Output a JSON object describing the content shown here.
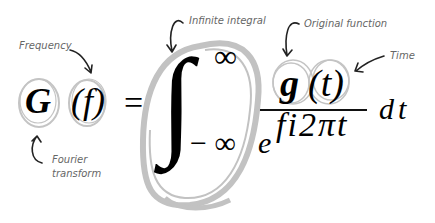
{
  "diagram": {
    "formula": {
      "lhs_function": "G",
      "lhs_argument": "(f)",
      "equals": "=",
      "integral_sign": "∫",
      "upper_limit": "∞",
      "lower_limit": "− ∞",
      "numerator_function": "g",
      "numerator_argument": "(t)",
      "denominator_base": "e",
      "denominator_exponent": "fi2πt",
      "differential": "dt"
    },
    "annotations": [
      {
        "id": "frequency",
        "text": "Frequency"
      },
      {
        "id": "fourier",
        "text_line1": "Fourier",
        "text_line2": "transform"
      },
      {
        "id": "integral",
        "text": "Infinite integral"
      },
      {
        "id": "original",
        "text": "Original function"
      },
      {
        "id": "time",
        "text": "Time"
      }
    ],
    "colors": {
      "ink": "#000000",
      "highlight_circle": "#bdbdbd",
      "annotation_text": "#666666",
      "arrow": "#222222"
    }
  }
}
